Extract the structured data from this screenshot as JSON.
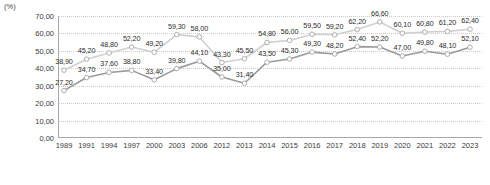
{
  "axis_unit_label": "(%)",
  "chart_data": {
    "type": "line",
    "title": "",
    "xlabel": "",
    "ylabel": "(%)",
    "ylim": [
      0,
      70
    ],
    "ytick_step": 10,
    "grid": true,
    "legend": "none",
    "value_labels": true,
    "decimal_separator": ",",
    "colors": {
      "series_upper_line": "#d0d0d0",
      "series_lower_line": "#9a9a9a",
      "marker_fill": "#ffffff",
      "marker_stroke": "#a6a6a6",
      "gridline": "#c9c9c9",
      "axis": "#a8a8a8",
      "text": "#2b2b2b"
    },
    "ytick_labels": [
      "70,00",
      "60,00",
      "50,00",
      "40,00",
      "30,00",
      "20,00",
      "10,00",
      "0,00"
    ],
    "ytick_values": [
      70,
      60,
      50,
      40,
      30,
      20,
      10,
      0
    ],
    "categories": [
      "1989",
      "1991",
      "1994",
      "1997",
      "2000",
      "2003",
      "2006",
      "2012",
      "2013",
      "2014",
      "2015",
      "2016",
      "2017",
      "2018",
      "2019",
      "2020",
      "2021",
      "2022",
      "2023"
    ],
    "series": [
      {
        "name": "upper",
        "values": [
          38.9,
          45.2,
          48.8,
          52.2,
          49.2,
          59.3,
          58.0,
          43.3,
          45.5,
          54.8,
          56.0,
          59.5,
          59.2,
          62.2,
          66.6,
          60.1,
          60.8,
          61.2,
          62.4
        ],
        "labels": [
          "38,90",
          "45,20",
          "48,80",
          "52,20",
          "49,20",
          "59,30",
          "58,00",
          "43,30",
          "45,50",
          "54,80",
          "56,00",
          "59,50",
          "59,20",
          "62,20",
          "66,60",
          "60,10",
          "60,80",
          "61,20",
          "62,40"
        ]
      },
      {
        "name": "lower",
        "values": [
          27.2,
          34.7,
          37.6,
          38.8,
          33.4,
          39.8,
          44.1,
          35.0,
          31.4,
          43.5,
          45.3,
          49.3,
          48.2,
          52.4,
          52.2,
          47.0,
          49.8,
          48.1,
          52.1
        ],
        "labels": [
          "27,20",
          "34,70",
          "37,60",
          "38,80",
          "33,40",
          "39,80",
          "44,10",
          "35,00",
          "31,40",
          "43,50",
          "45,30",
          "49,30",
          "48,20",
          "52,40",
          "52,20",
          "47,00",
          "49,80",
          "48,10",
          "52,10"
        ]
      }
    ]
  }
}
